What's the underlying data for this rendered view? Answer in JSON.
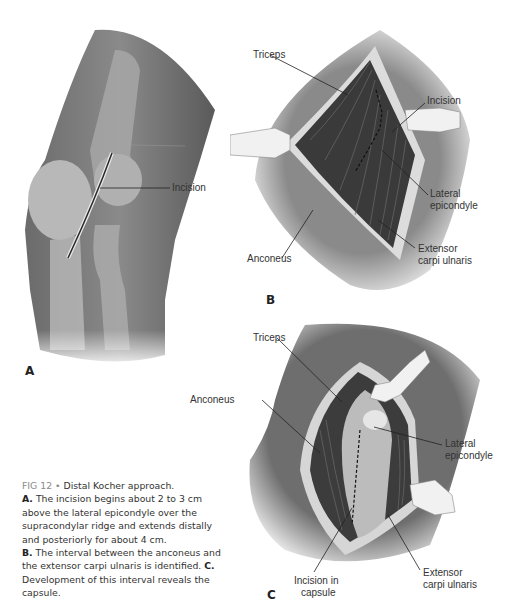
{
  "figure": {
    "number": "FIG 12",
    "separator": "•",
    "title": "Distal Kocher approach.",
    "caption_parts": [
      {
        "marker": "A.",
        "text": "The incision begins about 2 to 3 cm above the lateral epicondyle over the supracondylar ridge and extends distally and posteriorly for about 4 cm."
      },
      {
        "marker": "B.",
        "text": "The interval between the anconeus and the extensor carpi ulnaris is identified."
      },
      {
        "marker": "C.",
        "text": "Development of this interval reveals the capsule."
      }
    ]
  },
  "panels": {
    "a": {
      "letter": "A",
      "labels": {
        "incision": "Incision"
      }
    },
    "b": {
      "letter": "B",
      "labels": {
        "triceps": "Triceps",
        "incision": "Incision",
        "lateral_epicondyle_1": "Lateral",
        "lateral_epicondyle_2": "epicondyle",
        "anconeus": "Anconeus",
        "ecu_1": "Extensor",
        "ecu_2": "carpi ulnaris"
      }
    },
    "c": {
      "letter": "C",
      "labels": {
        "triceps": "Triceps",
        "anconeus": "Anconeus",
        "lateral_epicondyle_1": "Lateral",
        "lateral_epicondyle_2": "epicondyle",
        "incision_capsule_1": "Incision in",
        "incision_capsule_2": "capsule",
        "ecu_1": "Extensor",
        "ecu_2": "carpi ulnaris"
      }
    }
  },
  "colors": {
    "skin_dark": "#5a5a5a",
    "skin_mid": "#8c8c8c",
    "bone_light": "#c8c8c8",
    "muscle_dark": "#3a3a3a",
    "caption_grey": "#8a8a8a",
    "text": "#333333"
  }
}
